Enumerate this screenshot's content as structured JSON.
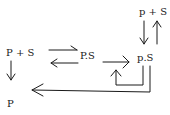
{
  "diagram": {
    "nodes": {
      "left_reactants": "P + S",
      "left_product": "P",
      "middle_complex": "P.S",
      "right_complex": "p.S",
      "top_right_reactants": "p + S"
    },
    "colors": {
      "ink": "#1a1a1a",
      "background": "#ffffff"
    }
  }
}
